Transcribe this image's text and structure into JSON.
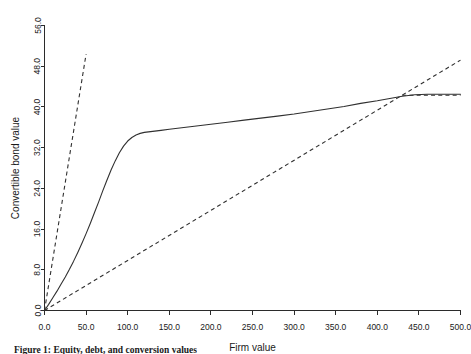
{
  "figure": {
    "caption": "Figure 1:  Equity, debt, and conversion values"
  },
  "chart_data": {
    "type": "line",
    "title": "",
    "xlabel": "Firm value",
    "ylabel": "Convertible bond value",
    "xlim": [
      0.0,
      500.0
    ],
    "ylim": [
      0.0,
      56.0
    ],
    "xticks": [
      0.0,
      50.0,
      100.0,
      150.0,
      200.0,
      250.0,
      300.0,
      350.0,
      400.0,
      450.0,
      500.0
    ],
    "xticklabels": [
      "0.0",
      "50.0",
      "100.0",
      "150.0",
      "200.0",
      "250.0",
      "300.0",
      "350.0",
      "400.0",
      "450.0",
      "500.0"
    ],
    "yticks": [
      0.0,
      8.0,
      16.0,
      24.0,
      32.0,
      40.0,
      48.0,
      56.0
    ],
    "yticklabels": [
      "0.0",
      "8.0",
      "16.0",
      "24.0",
      "32.0",
      "40.0",
      "48.0",
      "56.0"
    ],
    "grid": false,
    "legend": "none",
    "series": [
      {
        "name": "Convertible bond value",
        "style": "solid",
        "color": "#303030",
        "x": [
          0,
          5,
          10,
          15,
          20,
          25,
          30,
          35,
          40,
          45,
          50,
          55,
          60,
          65,
          70,
          75,
          80,
          85,
          90,
          95,
          100,
          105,
          110,
          115,
          120,
          130,
          140,
          150,
          160,
          180,
          200,
          220,
          240,
          260,
          280,
          300,
          320,
          340,
          360,
          380,
          400,
          420,
          430,
          445,
          460,
          480,
          500
        ],
        "y": [
          0.0,
          1.2,
          2.5,
          3.8,
          5.2,
          6.6,
          8.1,
          9.7,
          11.4,
          13.2,
          15.1,
          17.1,
          19.2,
          21.3,
          23.5,
          25.6,
          27.6,
          29.4,
          31.0,
          32.3,
          33.3,
          34.0,
          34.5,
          34.8,
          35.0,
          35.2,
          35.4,
          35.6,
          35.8,
          36.2,
          36.6,
          37.0,
          37.4,
          37.8,
          38.2,
          38.6,
          39.1,
          39.6,
          40.1,
          40.7,
          41.2,
          41.8,
          42.1,
          42.4,
          42.5,
          42.5,
          42.5
        ]
      },
      {
        "name": "Straight bond value",
        "style": "dashed",
        "color": "#303030",
        "x": [
          0,
          50
        ],
        "y": [
          0.0,
          50.4
        ]
      },
      {
        "name": "Conversion value",
        "style": "dashed",
        "color": "#303030",
        "x": [
          0,
          500
        ],
        "y": [
          0.0,
          49.2
        ]
      },
      {
        "name": "Call/cap level",
        "style": "dashed",
        "color": "#303030",
        "x": [
          430,
          500
        ],
        "y": [
          42.3,
          42.3
        ]
      }
    ]
  }
}
